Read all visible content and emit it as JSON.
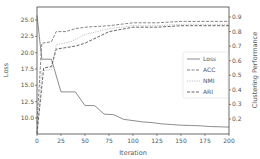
{
  "chart_data": {
    "type": "line",
    "title": "",
    "xlabel": "Iteration",
    "ylabel": "Loss",
    "ylabel_right": "Clustering Performance",
    "xlim": [
      0,
      200
    ],
    "ylim": [
      7.8,
      26.0
    ],
    "ylim_right": [
      0.1,
      0.97
    ],
    "x_ticks": [
      "0",
      "25",
      "50",
      "75",
      "100",
      "125",
      "150",
      "175",
      "200"
    ],
    "y_ticks": [
      "10.0",
      "12.5",
      "15.0",
      "17.5",
      "20.0",
      "22.5",
      "25.0"
    ],
    "y_ticks_right": [
      "0.2",
      "0.3",
      "0.4",
      "0.5",
      "0.6",
      "0.7",
      "0.8",
      "0.9"
    ],
    "grid": false,
    "legend_position": "center right",
    "series": [
      {
        "name": "Loss",
        "axis": "left",
        "style": "solid",
        "color": "#808080",
        "x": [
          0,
          5,
          15,
          25,
          40,
          50,
          60,
          70,
          80,
          90,
          100,
          110,
          120,
          130,
          140,
          150,
          160,
          170,
          180,
          190,
          200
        ],
        "values": [
          25.7,
          19.0,
          19.0,
          14.0,
          14.0,
          11.9,
          11.9,
          10.6,
          10.5,
          9.8,
          9.6,
          9.4,
          9.3,
          9.1,
          9.0,
          8.9,
          8.85,
          8.8,
          8.7,
          8.65,
          8.6
        ]
      },
      {
        "name": "ACC",
        "axis": "right",
        "style": "dashed",
        "color": "#777777",
        "x": [
          0,
          5,
          15,
          20,
          30,
          40,
          50,
          75,
          100,
          125,
          150,
          175,
          200
        ],
        "values": [
          0.17,
          0.72,
          0.73,
          0.8,
          0.8,
          0.82,
          0.83,
          0.84,
          0.86,
          0.86,
          0.87,
          0.87,
          0.87
        ]
      },
      {
        "name": "NMI",
        "axis": "right",
        "style": "dotted",
        "color": "#bbbbbb",
        "x": [
          0,
          5,
          15,
          20,
          35,
          50,
          75,
          100,
          125,
          150,
          175,
          200
        ],
        "values": [
          0.1,
          0.53,
          0.54,
          0.71,
          0.73,
          0.78,
          0.82,
          0.84,
          0.84,
          0.85,
          0.85,
          0.85
        ]
      },
      {
        "name": "ARI",
        "axis": "right",
        "style": "dashed",
        "color": "#555555",
        "x": [
          0,
          7,
          15,
          20,
          30,
          40,
          50,
          75,
          100,
          125,
          150,
          175,
          200
        ],
        "values": [
          0.1,
          0.55,
          0.56,
          0.68,
          0.69,
          0.7,
          0.72,
          0.8,
          0.83,
          0.83,
          0.84,
          0.84,
          0.84
        ]
      }
    ]
  }
}
